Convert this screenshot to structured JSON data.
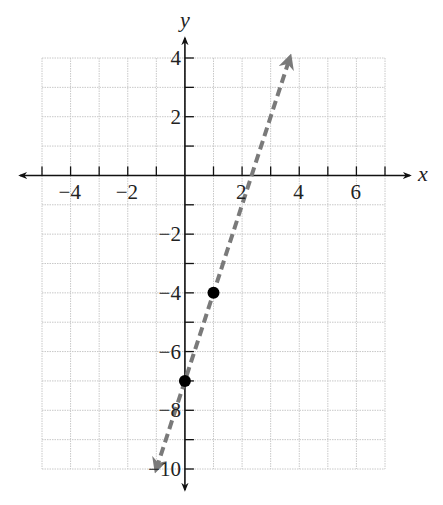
{
  "chart_data": {
    "type": "line",
    "title": "",
    "xlabel": "x",
    "ylabel": "y",
    "xlim": [
      -5,
      7
    ],
    "ylim": [
      -10,
      4
    ],
    "grid": true,
    "grid_step": 1,
    "x_tick_labels": [
      "-4",
      "-2",
      "2",
      "4",
      "6"
    ],
    "x_tick_values": [
      -4,
      -2,
      2,
      4,
      6
    ],
    "y_tick_labels": [
      "4",
      "2",
      "-2",
      "-4",
      "-6",
      "-8",
      "-10"
    ],
    "y_tick_values": [
      4,
      2,
      -2,
      -4,
      -6,
      -8,
      -10
    ],
    "series": [
      {
        "name": "y = 3x - 7",
        "style": "dashed",
        "arrows": "both",
        "slope": 3,
        "intercept": -7,
        "x": [
          -1,
          3.667
        ],
        "y": [
          -10,
          4
        ]
      }
    ],
    "points": [
      {
        "x": 0,
        "y": -7,
        "label": "(0, -7)"
      },
      {
        "x": 1,
        "y": -4,
        "label": "(1, -4)"
      }
    ],
    "colors": {
      "line": "#7a7a7a",
      "axis": "#111111",
      "grid": "#c8c8c8",
      "point": "#000000"
    }
  }
}
